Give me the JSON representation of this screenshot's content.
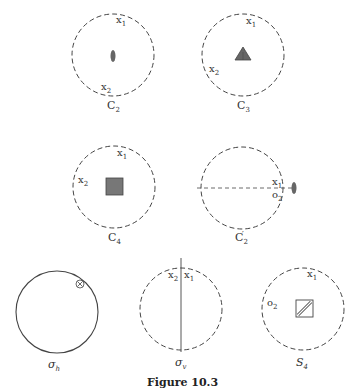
{
  "figure": {
    "caption": "Figure 10.3",
    "panels": [
      {
        "id": "c2",
        "name": "C",
        "sub": "2",
        "labels": [
          {
            "t": "x",
            "s": "1"
          },
          {
            "t": "x",
            "s": "2"
          }
        ],
        "symbol": "ellipse",
        "circle": "dashed"
      },
      {
        "id": "c3",
        "name": "C",
        "sub": "3",
        "labels": [
          {
            "t": "x",
            "s": "1"
          },
          {
            "t": "x",
            "s": "2"
          }
        ],
        "symbol": "triangle",
        "circle": "dashed"
      },
      {
        "id": "c4",
        "name": "C",
        "sub": "4",
        "labels": [
          {
            "t": "x",
            "s": "1"
          },
          {
            "t": "x",
            "s": "2"
          }
        ],
        "symbol": "square",
        "circle": "dashed"
      },
      {
        "id": "c2p",
        "name": "C",
        "sub": "2",
        "prime": "′",
        "labels": [
          {
            "t": "x",
            "s": "1"
          },
          {
            "t": "o",
            "s": "2"
          }
        ],
        "symbol": "ellipse-edge",
        "circle": "dashed"
      },
      {
        "id": "sh",
        "name": "σ",
        "sub": "h",
        "labels": [
          {
            "t": "⊗",
            "s": ""
          }
        ],
        "symbol": "none",
        "circle": "solid"
      },
      {
        "id": "sv",
        "name": "σ",
        "sub": "v",
        "labels": [
          {
            "t": "x",
            "s": "2"
          },
          {
            "t": "x",
            "s": "1"
          }
        ],
        "symbol": "line",
        "circle": "dashed"
      },
      {
        "id": "s4",
        "name": "S",
        "sub": "4",
        "labels": [
          {
            "t": "x",
            "s": "1"
          },
          {
            "t": "o",
            "s": "2"
          }
        ],
        "symbol": "square-hatched",
        "circle": "dashed"
      }
    ]
  },
  "colors": {
    "ink": "#333333",
    "fill": "#777777"
  }
}
